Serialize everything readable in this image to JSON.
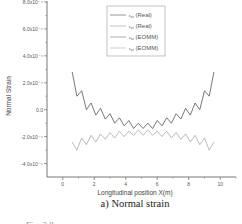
{
  "chart_data": {
    "type": "line",
    "title": "",
    "caption": "a) Normal strain",
    "figure_label_cut": "Fig. 3.8 ...",
    "xlabel": "Longitudinal position X(m)",
    "ylabel": "Normal Strain",
    "xlim": [
      -1,
      11
    ],
    "ylim": [
      -0.0005,
      0.0008
    ],
    "xticks": [
      0,
      2,
      4,
      6,
      8,
      10
    ],
    "xtick_labels": [
      "0",
      "2",
      "4",
      "6",
      "8",
      "10"
    ],
    "yticks": [
      -0.0004,
      -0.0002,
      0,
      0.0002,
      0.0004,
      0.0006,
      0.0008
    ],
    "ytick_labels": [
      "-4.0x10⁻⁴",
      "-2.0x10⁻⁴",
      "0.0",
      "2.0x10⁻⁴",
      "4.0x10⁻⁴",
      "6.0x10⁻⁴",
      "8.0x10⁻⁴"
    ],
    "grid": false,
    "legend_position": "top-right",
    "series": [
      {
        "name": "εxx (Real)",
        "color": "#555555",
        "x": [
          0.6,
          0.9,
          1.2,
          1.5,
          1.8,
          2.1,
          2.4,
          2.7,
          3.0,
          3.3,
          3.6,
          3.9,
          4.2,
          4.5,
          4.8,
          5.1,
          5.4,
          5.7,
          6.0,
          6.3,
          6.6,
          6.9,
          7.2,
          7.5,
          7.8,
          8.1,
          8.4,
          8.7,
          9.0,
          9.3,
          9.6
        ],
        "values": [
          0.00028,
          0.0001,
          0.00014,
          0.0,
          5e-05,
          -4e-05,
          1e-05,
          -7e-05,
          -3e-05,
          -0.0001,
          -6e-05,
          -0.00012,
          -8e-05,
          -0.00014,
          -0.0001,
          -0.00014,
          -0.0001,
          -0.00014,
          -8e-05,
          -0.00012,
          -6e-05,
          -0.0001,
          -3e-05,
          -7e-05,
          1e-05,
          -4e-05,
          5e-05,
          0.0,
          0.00014,
          0.0001,
          0.00028
        ]
      },
      {
        "name": "εzz (Real)",
        "color": "#aaaaaa",
        "x": [
          0.6,
          0.9,
          1.2,
          1.5,
          1.8,
          2.1,
          2.4,
          2.7,
          3.0,
          3.3,
          3.6,
          3.9,
          4.2,
          4.5,
          4.8,
          5.1,
          5.4,
          5.7,
          6.0,
          6.3,
          6.6,
          6.9,
          7.2,
          7.5,
          7.8,
          8.1,
          8.4,
          8.7,
          9.0,
          9.3,
          9.6
        ],
        "values": [
          -0.00024,
          -0.0003,
          -0.00021,
          -0.00026,
          -0.00019,
          -0.00024,
          -0.00018,
          -0.00022,
          -0.00017,
          -0.00021,
          -0.00016,
          -0.0002,
          -0.00016,
          -0.00019,
          -0.00015,
          -0.00019,
          -0.00015,
          -0.00019,
          -0.00016,
          -0.0002,
          -0.00016,
          -0.00021,
          -0.00017,
          -0.00022,
          -0.00018,
          -0.00024,
          -0.00019,
          -0.00026,
          -0.00021,
          -0.0003,
          -0.00024
        ]
      },
      {
        "name": "εxx (EOMM)",
        "color": "#999999",
        "x": [],
        "values": []
      },
      {
        "name": "εzz (EOMM)",
        "color": "#bbbbbb",
        "x": [],
        "values": []
      }
    ],
    "legend": [
      {
        "label_main": "ε",
        "label_sub": "xx",
        "label_tail": " (Real)",
        "color": "#666666"
      },
      {
        "label_main": "ε",
        "label_sub": "zz",
        "label_tail": " (Real)",
        "color": "#aaaaaa"
      },
      {
        "label_main": "ε",
        "label_sub": "xx",
        "label_tail": " (EOMM)",
        "color": "#888888"
      },
      {
        "label_main": "ε",
        "label_sub": "zz",
        "label_tail": " (EOMM)",
        "color": "#bbbbbb"
      }
    ]
  }
}
